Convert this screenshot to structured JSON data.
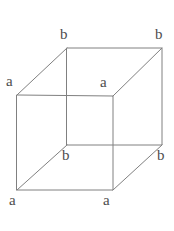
{
  "figure": {
    "kind": "cube-wireframe-diagram",
    "width": 174,
    "height": 231,
    "background_color": "#ffffff",
    "line_color": "#808080",
    "line_width": 1,
    "label_color": "#4d4d4d",
    "label_font_size": 15
  },
  "geometry": {
    "front_face": {
      "name": "front-square",
      "top_left": [
        17,
        95
      ],
      "top_right": [
        113,
        96
      ],
      "bottom_right": [
        113,
        190
      ],
      "bottom_left": [
        17,
        190
      ]
    },
    "back_face": {
      "name": "back-square",
      "top_left": [
        67,
        48
      ],
      "top_right": [
        162,
        48
      ],
      "bottom_right": [
        162,
        145
      ],
      "bottom_left": [
        67,
        145
      ]
    },
    "connector_edges": [
      [
        [
          17,
          95
        ],
        [
          67,
          48
        ]
      ],
      [
        [
          113,
          96
        ],
        [
          162,
          48
        ]
      ],
      [
        [
          113,
          190
        ],
        [
          162,
          145
        ]
      ],
      [
        [
          17,
          190
        ],
        [
          67,
          145
        ]
      ]
    ]
  },
  "labels": [
    {
      "id": "back-top-left",
      "text": "b",
      "x": 60,
      "y": 27
    },
    {
      "id": "back-top-right",
      "text": "b",
      "x": 155,
      "y": 27
    },
    {
      "id": "front-top-left",
      "text": "a",
      "x": 6,
      "y": 74
    },
    {
      "id": "front-top-right",
      "text": "a",
      "x": 100,
      "y": 75
    },
    {
      "id": "back-bottom-left",
      "text": "b",
      "x": 62,
      "y": 148
    },
    {
      "id": "back-bottom-right",
      "text": "b",
      "x": 157,
      "y": 148
    },
    {
      "id": "front-bottom-left",
      "text": "a",
      "x": 9,
      "y": 193
    },
    {
      "id": "front-bottom-mid",
      "text": "a",
      "x": 103,
      "y": 193
    }
  ]
}
